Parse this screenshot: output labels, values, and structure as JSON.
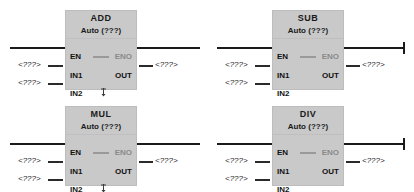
{
  "diagram": {
    "type": "fbd-ladder",
    "operand_placeholder": "<???>",
    "mode_text": "Auto (???)",
    "pins": {
      "en": "EN",
      "eno": "ENO",
      "in1": "IN1",
      "in2": "IN2",
      "out": "OUT"
    },
    "colors": {
      "block_fill": "#c9c9c9",
      "wire": "#1a1a1a",
      "pin_text": "#111111",
      "eno_text": "#8a8a8a",
      "background": "#ffffff"
    },
    "blocks": [
      {
        "id": "add",
        "name": "ADD",
        "mode": "Auto (???)",
        "in1": "<???>",
        "in2": "<???>",
        "out": "<???>",
        "has_in2_marker": true,
        "eno_terminator": false,
        "position": {
          "x": 0,
          "y": 0
        }
      },
      {
        "id": "sub",
        "name": "SUB",
        "mode": "Auto (???)",
        "in1": "<???>",
        "in2": "<???>",
        "out": "<???>",
        "has_in2_marker": false,
        "eno_terminator": true,
        "position": {
          "x": 207,
          "y": 0
        }
      },
      {
        "id": "mul",
        "name": "MUL",
        "mode": "Auto (???)",
        "in1": "<???>",
        "in2": "<???>",
        "out": "<???>",
        "has_in2_marker": true,
        "eno_terminator": false,
        "position": {
          "x": 0,
          "y": 96
        }
      },
      {
        "id": "div",
        "name": "DIV",
        "mode": "Auto (???)",
        "in1": "<???>",
        "in2": "<???>",
        "out": "<???>",
        "has_in2_marker": false,
        "eno_terminator": true,
        "position": {
          "x": 207,
          "y": 96
        }
      }
    ]
  }
}
